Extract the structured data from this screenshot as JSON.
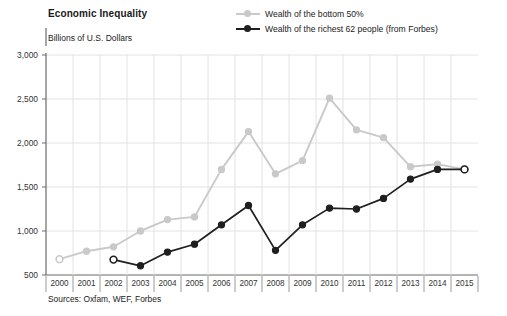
{
  "chart_data": {
    "type": "line",
    "title": "Economic Inequality",
    "ylabel": "Billions of U.S. Dollars",
    "xlabel": "",
    "source_note": "Sources: Oxfam, WEF, Forbes",
    "grid": true,
    "legend_position": "top-right",
    "ylim": [
      500,
      3000
    ],
    "yticks": [
      500,
      1000,
      1500,
      2000,
      2500,
      3000
    ],
    "ytick_labels": [
      "500",
      "1,000",
      "1,500",
      "2,000",
      "2,500",
      "3,000"
    ],
    "categories": [
      2000,
      2001,
      2002,
      2003,
      2004,
      2005,
      2006,
      2007,
      2008,
      2009,
      2010,
      2011,
      2012,
      2013,
      2014,
      2015
    ],
    "xtick_labels": [
      "2000",
      "2001",
      "2002",
      "2003",
      "2004",
      "2005",
      "2006",
      "2007",
      "2008",
      "2009",
      "2010",
      "2011",
      "2012",
      "2013",
      "2014",
      "2015"
    ],
    "series": [
      {
        "name": "Wealth of the bottom 50%",
        "color": "#c9c9c9",
        "x": [
          2000,
          2001,
          2002,
          2003,
          2004,
          2005,
          2006,
          2007,
          2008,
          2009,
          2010,
          2011,
          2012,
          2013,
          2014,
          2015
        ],
        "values": [
          680,
          770,
          820,
          1000,
          1130,
          1160,
          1700,
          2130,
          1650,
          1800,
          2510,
          2150,
          2060,
          1730,
          1760,
          1700
        ],
        "open_markers": [
          2000,
          2015
        ]
      },
      {
        "name": "Wealth of the richest 62 people (from Forbes)",
        "color": "#1f1f1f",
        "x": [
          2002,
          2003,
          2004,
          2005,
          2006,
          2007,
          2008,
          2009,
          2010,
          2011,
          2012,
          2013,
          2014,
          2015
        ],
        "values": [
          675,
          605,
          760,
          850,
          1070,
          1290,
          780,
          1070,
          1260,
          1250,
          1370,
          1590,
          1700,
          1700
        ],
        "open_markers": [
          2002,
          2015
        ]
      }
    ]
  }
}
